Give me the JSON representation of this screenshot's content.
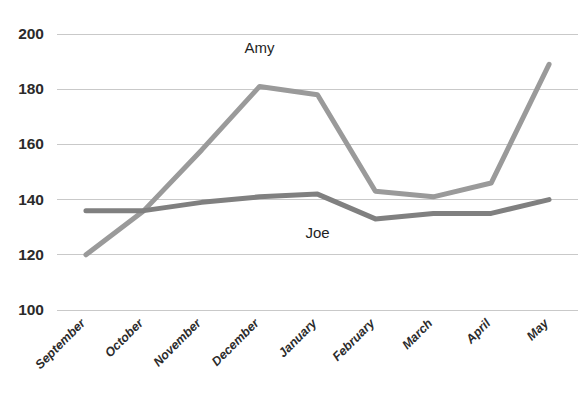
{
  "chart_data": {
    "type": "line",
    "title": "",
    "xlabel": "",
    "ylabel": "",
    "categories": [
      "September",
      "October",
      "November",
      "December",
      "January",
      "February",
      "March",
      "April",
      "May"
    ],
    "series": [
      {
        "name": "Amy",
        "color": "#9a9a9a",
        "values": [
          120,
          136,
          158,
          181,
          178,
          143,
          141,
          146,
          189
        ]
      },
      {
        "name": "Joe",
        "color": "#808080",
        "values": [
          136,
          136,
          139,
          141,
          142,
          133,
          135,
          135,
          140
        ]
      }
    ],
    "ylim": [
      100,
      200
    ],
    "yticks": [
      100,
      120,
      140,
      160,
      180,
      200
    ],
    "ytick_labels": [
      "100",
      "120",
      "140",
      "160",
      "180",
      "200"
    ],
    "grid": true,
    "grid_axis": "y",
    "legend": "none",
    "annotations": [
      {
        "text": "Amy",
        "series": "Amy",
        "x_category": "December",
        "value": 193
      },
      {
        "text": "Joe",
        "series": "Joe",
        "x_category": "January",
        "value": 126
      }
    ]
  },
  "style": {
    "background": "#ffffff",
    "gridline_color": "#c9c9c9",
    "tick_text_color": "#2b2b2b",
    "annotation_text_color": "#1f1f1f",
    "line_width": 5
  }
}
